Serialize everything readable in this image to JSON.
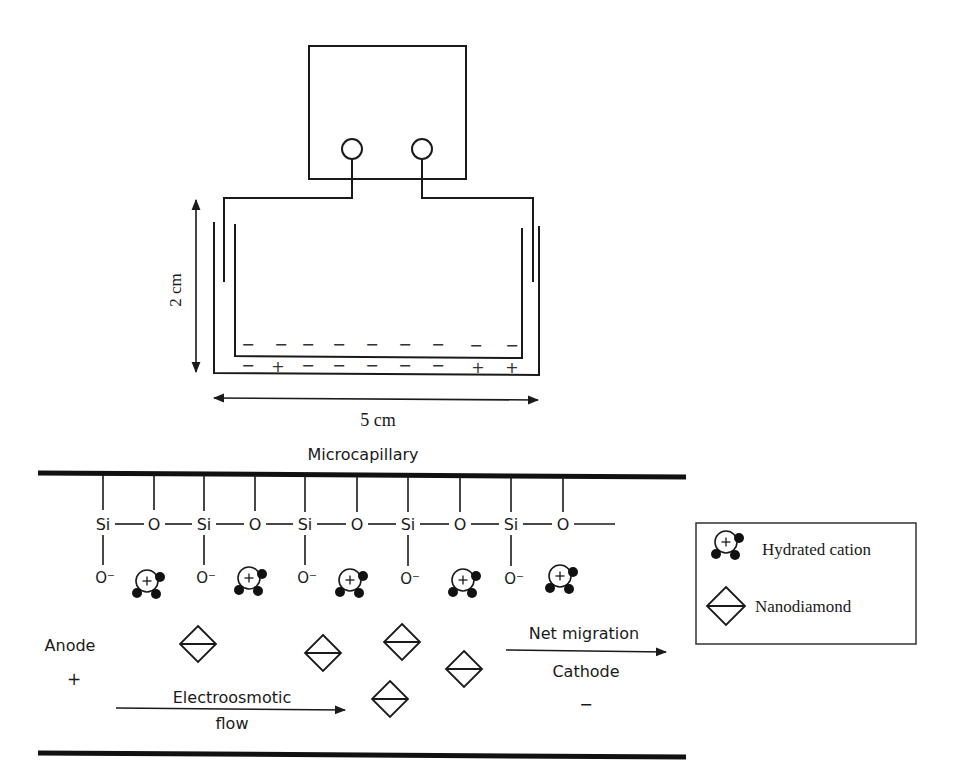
{
  "apparatus": {
    "height_label": "2 cm",
    "width_label": "5 cm",
    "upper_charges": [
      "−",
      "−",
      "−",
      "−",
      "−",
      "−",
      "−",
      "−",
      "−"
    ],
    "lower_charges": [
      "−",
      "+",
      "−",
      "−",
      "−",
      "−",
      "−",
      "+",
      "+"
    ]
  },
  "capillary": {
    "title": "Microcapillary",
    "chain": [
      "Si",
      "O",
      "Si",
      "O",
      "Si",
      "O",
      "Si",
      "O",
      "Si",
      "O"
    ],
    "silanol_label": "O⁻",
    "cation_symbol": "+",
    "anode_label": "Anode",
    "anode_sign": "+",
    "cathode_label": "Cathode",
    "cathode_sign": "−",
    "eof_label_line1": "Electroosmotic",
    "eof_label_line2": "flow",
    "net_migration_label": "Net migration"
  },
  "legend": {
    "items": [
      {
        "icon": "hydrated-cation-icon",
        "label": "Hydrated cation"
      },
      {
        "icon": "nanodiamond-icon",
        "label": "Nanodiamond"
      }
    ]
  }
}
